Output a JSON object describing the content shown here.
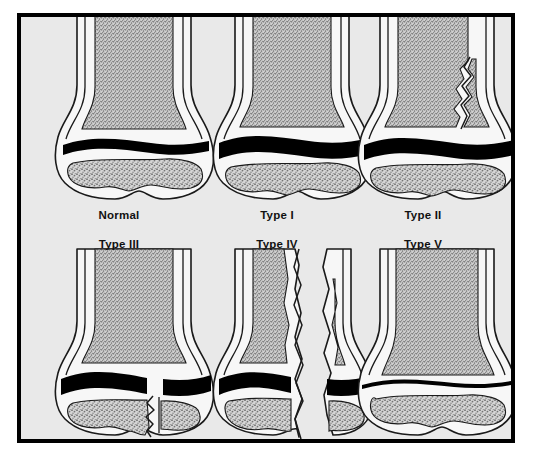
{
  "figure": {
    "background_color": "#e9e9e9",
    "frame_color": "#000000",
    "page_color": "#ffffff",
    "bone_marrow_color": "#9a9a9a",
    "bone_cortex_color": "#f5f5f5",
    "physis_color": "#000000",
    "outline_color": "#1a1a1a"
  },
  "panels": [
    {
      "id": "normal",
      "label": "Normal",
      "row": 1,
      "column": 1,
      "physis_state": "intact",
      "fracture": "none",
      "description": "Intact growth plate with no fracture line"
    },
    {
      "id": "type-1",
      "label": "Type I",
      "row": 1,
      "column": 2,
      "physis_state": "widened",
      "fracture": "physeal separation only",
      "description": "Fracture through the growth plate; epiphysis separated from metaphysis"
    },
    {
      "id": "type-2",
      "label": "Type II",
      "row": 1,
      "column": 3,
      "physis_state": "widened",
      "fracture": "physis plus metaphyseal fragment",
      "description": "Fracture through growth plate exiting through the metaphysis (Thurston-Holland fragment)"
    },
    {
      "id": "type-3",
      "label": "Type III",
      "row": 2,
      "column": 1,
      "physis_state": "widened",
      "fracture": "physis plus epiphyseal split",
      "description": "Fracture through growth plate exiting through the epiphysis into the joint"
    },
    {
      "id": "type-4",
      "label": "Type IV",
      "row": 2,
      "column": 2,
      "physis_state": "split",
      "fracture": "metaphysis through physis through epiphysis",
      "description": "Vertical fracture crossing metaphysis, growth plate and epiphysis"
    },
    {
      "id": "type-5",
      "label": "Type V",
      "row": 2,
      "column": 3,
      "physis_state": "compressed",
      "fracture": "crush injury of the physis",
      "description": "Compression/crush injury of the growth plate; physis appears thinned"
    }
  ]
}
